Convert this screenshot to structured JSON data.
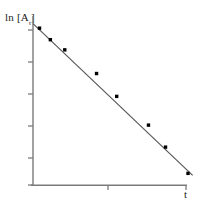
{
  "figure": {
    "title": "",
    "background_color": "#ffffff",
    "width": 198,
    "height": 204
  },
  "axes": {
    "ylabel_text": "ln [A",
    "ylabel_subscript": "t",
    "ylabel_close": "]",
    "ylabel_full": "ln [A_t]",
    "xlabel": "t",
    "axis_color": "#7a7a7a",
    "tick_color": "#7a7a7a"
  },
  "chart_data": {
    "type": "scatter",
    "title": "",
    "subtitle": "",
    "xlabel": "t",
    "ylabel": "ln [A_t]",
    "legend": [],
    "legend_position": "none",
    "grid": false,
    "xlim": [
      0,
      10
    ],
    "ylim": [
      0,
      10
    ],
    "xticks": [
      5,
      10
    ],
    "yticks": [
      2,
      4,
      6,
      8,
      10
    ],
    "xtick_labels": [
      "",
      ""
    ],
    "ytick_labels": [
      "",
      "",
      "",
      "",
      ""
    ],
    "axis_note": "Unlabeled tick marks; qualitative first-order kinetics plot",
    "series": [
      {
        "name": "ln [A_t] data",
        "marker": "square",
        "marker_color": "#000000",
        "x": [
          0.42,
          1.12,
          2.05,
          4.1,
          5.4,
          7.45,
          8.55,
          10.0
        ],
        "y": [
          9.28,
          8.6,
          8.0,
          6.6,
          5.25,
          3.55,
          2.25,
          0.7
        ]
      },
      {
        "name": "linear fit",
        "marker": "none",
        "line_color": "#555555",
        "line_style": "solid",
        "x": [
          0.0,
          10.3
        ],
        "y": [
          9.55,
          0.58
        ],
        "slope": -0.871,
        "intercept": 9.55,
        "description": "negative-slope straight line through the data"
      }
    ]
  }
}
